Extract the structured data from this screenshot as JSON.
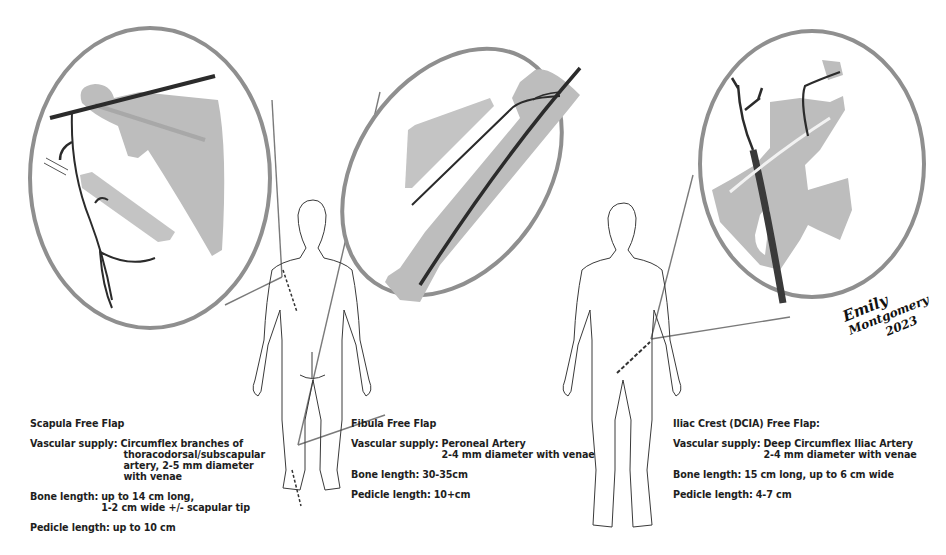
{
  "figure": {
    "colors": {
      "bone": "#bdbdbd",
      "vessel": "#2b2b2b",
      "circle_ring": "#8f8f8f",
      "body_outline": "#3a3a3a",
      "text": "#1e1e1e"
    },
    "signature": {
      "line1": "Emily",
      "line2": "Montgomery",
      "year": "2023"
    }
  },
  "panels": [
    {
      "title": "Scapula Free Flap",
      "vascular_label": "Vascular supply:",
      "vascular_lines": [
        "Circumflex branches of",
        "thoracodorsal/subscapular",
        "artery, 2-5 mm diameter",
        "with venae"
      ],
      "bone_label": "Bone length:",
      "bone_lines": [
        "up to 14 cm long,",
        "1-2 cm wide +/- scapular tip"
      ],
      "pedicle_label": "Pedicle length:",
      "pedicle_value": "up to 10 cm"
    },
    {
      "title": "Fibula Free Flap",
      "vascular_label": "Vascular supply:",
      "vascular_lines": [
        "Peroneal Artery",
        "2-4 mm diameter with venae"
      ],
      "bone_label": "Bone length:",
      "bone_lines": [
        "30-35cm"
      ],
      "pedicle_label": "Pedicle length:",
      "pedicle_value": "10+cm"
    },
    {
      "title": "Iliac Crest (DCIA) Free Flap:",
      "vascular_label": "Vascular supply:",
      "vascular_lines": [
        "Deep Circumflex Iliac Artery",
        "2-4 mm diameter with venae"
      ],
      "bone_label": "Bone length:",
      "bone_lines": [
        "15 cm long, up to 6 cm wide"
      ],
      "pedicle_label": "Pedicle length:",
      "pedicle_value": "4-7 cm"
    }
  ]
}
